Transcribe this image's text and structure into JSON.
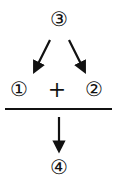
{
  "diagram": {
    "top_node": {
      "label": "③"
    },
    "left_node": {
      "label": "①"
    },
    "operator": {
      "label": "+"
    },
    "right_node": {
      "label": "②"
    },
    "bottom_node": {
      "label": "④"
    },
    "colors": {
      "stroke": "#111111",
      "background": "#ffffff"
    }
  }
}
